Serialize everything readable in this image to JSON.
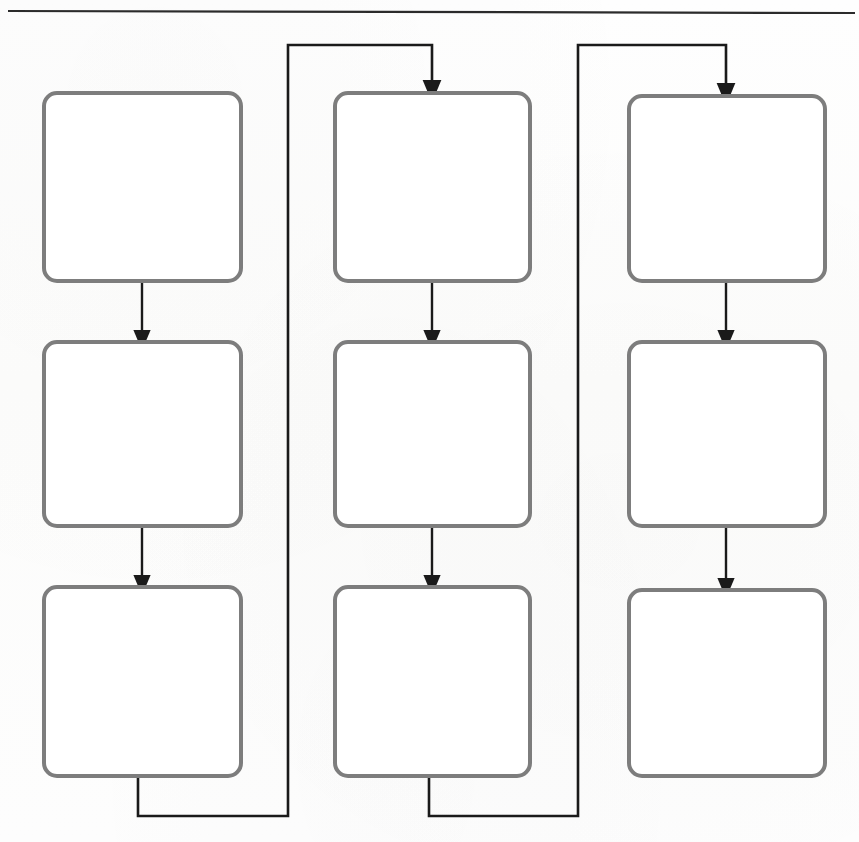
{
  "page": {
    "width": 859,
    "height": 842,
    "background_color": "#fdfdfc",
    "kind": "scanned-flowchart-worksheet"
  },
  "header_rule": {
    "name": "horizontal-rule",
    "color": "#2b2b2b",
    "x1": 8,
    "x2": 855,
    "y": 11,
    "thickness": 2.2
  },
  "style": {
    "box_stroke_color": "#7d7d7d",
    "box_fill_color": "#ffffff",
    "box_stroke_width": 4,
    "box_corner_radius": 13,
    "connector_color": "#1a1a1a",
    "connector_width": 2.4,
    "loop_connector_color": "#1a1a1a",
    "loop_connector_width": 2.6
  },
  "diagram": {
    "title": "",
    "columns": [
      {
        "name": "column-1",
        "index": 1,
        "x": 42,
        "width": 201,
        "nodes": [
          {
            "id": "c1r1",
            "label": "",
            "x": 42,
            "y": 91,
            "width": 201,
            "height": 192
          },
          {
            "id": "c1r2",
            "label": "",
            "x": 42,
            "y": 340,
            "width": 201,
            "height": 188
          },
          {
            "id": "c1r3",
            "label": "",
            "x": 42,
            "y": 585,
            "width": 201,
            "height": 193
          }
        ]
      },
      {
        "name": "column-2",
        "index": 2,
        "x": 333,
        "width": 199,
        "nodes": [
          {
            "id": "c2r1",
            "label": "",
            "x": 333,
            "y": 91,
            "width": 199,
            "height": 192
          },
          {
            "id": "c2r2",
            "label": "",
            "x": 333,
            "y": 340,
            "width": 199,
            "height": 188
          },
          {
            "id": "c2r3",
            "label": "",
            "x": 333,
            "y": 585,
            "width": 199,
            "height": 193
          }
        ]
      },
      {
        "name": "column-3",
        "index": 3,
        "x": 627,
        "width": 200,
        "nodes": [
          {
            "id": "c3r1",
            "label": "",
            "x": 627,
            "y": 94,
            "width": 200,
            "height": 189
          },
          {
            "id": "c3r2",
            "label": "",
            "x": 627,
            "y": 340,
            "width": 200,
            "height": 188
          },
          {
            "id": "c3r3",
            "label": "",
            "x": 627,
            "y": 588,
            "width": 200,
            "height": 190
          }
        ]
      }
    ],
    "arrows": [
      {
        "name": "arrow-c1r1-to-c1r2",
        "x": 142,
        "y1": 283,
        "y2": 340
      },
      {
        "name": "arrow-c1r2-to-c1r3",
        "x": 142,
        "y1": 528,
        "y2": 585
      },
      {
        "name": "arrow-c2r1-to-c2r2",
        "x": 432,
        "y1": 283,
        "y2": 340
      },
      {
        "name": "arrow-c2r2-to-c2r3",
        "x": 432,
        "y1": 528,
        "y2": 585
      },
      {
        "name": "arrow-c3r1-to-c3r2",
        "x": 726,
        "y1": 283,
        "y2": 340
      },
      {
        "name": "arrow-c3r2-to-c3r3",
        "x": 726,
        "y1": 528,
        "y2": 588
      }
    ],
    "loop_connectors": [
      {
        "name": "loop-c1r3-to-c2r1",
        "from": "c1r3",
        "to": "c2r1",
        "path": "M 138 778 L 138 816 L 288 816 L 288 45 L 432 45 L 432 91",
        "arrowhead_at": {
          "x": 432,
          "y": 91
        }
      },
      {
        "name": "loop-c2r3-to-c3r1",
        "from": "c2r3",
        "to": "c3r1",
        "path": "M 429 778 L 429 816 L 578 816 L 578 45 L 726 45 L 726 94",
        "arrowhead_at": {
          "x": 726,
          "y": 94
        }
      }
    ],
    "node_count": 9,
    "arrow_count": 6,
    "loop_connector_count": 2
  }
}
